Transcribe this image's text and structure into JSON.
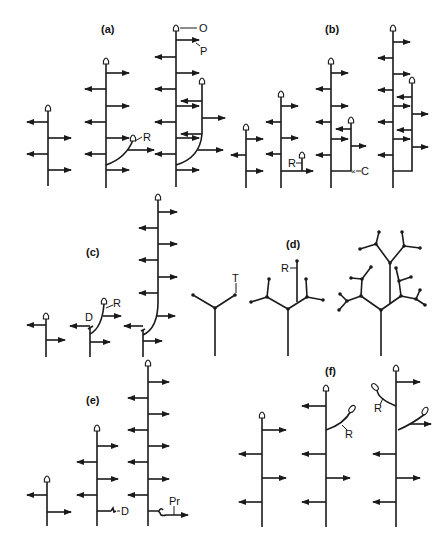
{
  "figure": {
    "top_header_fragment": "",
    "panels": [
      {
        "id": "a",
        "label": "(a)",
        "annotations": {
          "O": "O",
          "P": "P",
          "R": "R"
        }
      },
      {
        "id": "b",
        "label": "(b)",
        "annotations": {
          "R": "R",
          "C": "C"
        }
      },
      {
        "id": "c",
        "label": "(c)",
        "annotations": {
          "D": "D",
          "R": "R"
        }
      },
      {
        "id": "d",
        "label": "(d)",
        "annotations": {
          "T": "T",
          "R": "R"
        }
      },
      {
        "id": "e",
        "label": "(e)",
        "annotations": {
          "D": "D",
          "Pr": "Pr"
        }
      },
      {
        "id": "f",
        "label": "(f)",
        "annotations": {
          "R1": "R",
          "R2": "R"
        }
      }
    ]
  },
  "colors": {
    "ink": "#1a1a1a",
    "background": "#ffffff"
  }
}
